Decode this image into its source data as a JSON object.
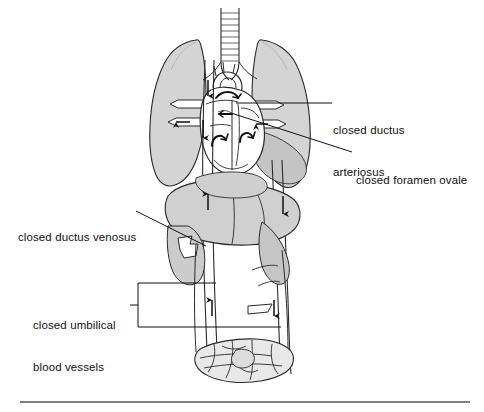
{
  "figure": {
    "background_color": "#ffffff",
    "line_color": "#1a1a1a",
    "organ_fill_light": "#d9d9d9",
    "organ_fill_mid": "#c9c9c9",
    "organ_fill_dark": "#b9b9b9",
    "vessel_fill": "#ffffff"
  },
  "labels": {
    "ductus_arteriosus": {
      "line1": "closed ductus",
      "line2": "arteriosus"
    },
    "foramen_ovale": {
      "line1": "closed foramen ovale"
    },
    "ductus_venosus": {
      "line1": "closed ductus venosus"
    },
    "umbilical": {
      "line1": "closed umbilical",
      "line2": "blood vessels"
    }
  },
  "anatomy": {
    "trachea": "trachea-with-cartilage-rings",
    "left_lung": "left-lung",
    "right_lung": "right-lung",
    "heart": "heart",
    "aortic_arch": "aortic-arch",
    "liver": "liver",
    "pelvis": "pelvic-bones",
    "aorta": "descending-aorta",
    "vena_cava": "inferior-vena-cava"
  },
  "flow_arrows": [
    {
      "name": "arrow-superior-vena-cava-down",
      "direction": "down"
    },
    {
      "name": "arrow-aorta-descending-upper",
      "direction": "down"
    },
    {
      "name": "arrow-pulmonary-left-out",
      "direction": "left"
    },
    {
      "name": "arrow-pulmonary-right-in",
      "direction": "left"
    },
    {
      "name": "arrow-right-atrium-swirl",
      "direction": "curved"
    },
    {
      "name": "arrow-left-ventricle-swirl",
      "direction": "curved"
    },
    {
      "name": "arrow-right-ventricle-swirl",
      "direction": "curved"
    },
    {
      "name": "arrow-vena-cava-up-liver",
      "direction": "up"
    },
    {
      "name": "arrow-aorta-down-liver",
      "direction": "down"
    },
    {
      "name": "arrow-vena-cava-up-pelvis",
      "direction": "up"
    },
    {
      "name": "arrow-aorta-down-pelvis",
      "direction": "down"
    }
  ],
  "footer_rule": {
    "name": "horizontal-rule",
    "color": "#555555"
  }
}
